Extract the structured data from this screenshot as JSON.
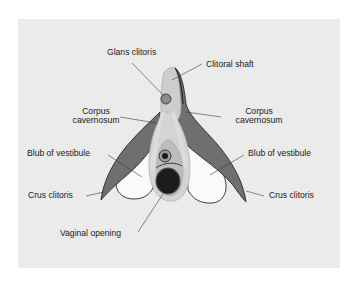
{
  "figure": {
    "background_color": "#ffffff",
    "panel_color": "#ebebeb",
    "colors": {
      "corpus_cavernosum": "#6f6f6f",
      "clitoral_shaft": "#c9c9c9",
      "bulb_of_vestibule": "#fafafa",
      "vaginal_canal": "#c4c4c4",
      "openings": "#1c1c1c",
      "outline": "#2a2a2a"
    }
  },
  "labels": {
    "glans_clitoris": "Glans clitoris",
    "clitoral_shaft": "Clitoral shaft",
    "corpus_cavernosum_left_line1": "Corpus",
    "corpus_cavernosum_left_line2": "cavernosum",
    "corpus_cavernosum_right_line1": "Corpus",
    "corpus_cavernosum_right_line2": "cavernosum",
    "bulb_of_vestibule_left": "Blub of vestibule",
    "bulb_of_vestibule_right": "Blub of vestibule",
    "crus_clitoris_left": "Crus clitoris",
    "crus_clitoris_right": "Crus clitoris",
    "vaginal_opening": "Vaginal opening"
  }
}
